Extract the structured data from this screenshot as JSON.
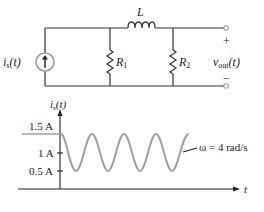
{
  "circuit": {
    "source_label": "i",
    "source_sub": "s",
    "source_arg": "(t)",
    "inductor_label": "L",
    "r1_label": "R",
    "r1_sub": "1",
    "r2_label": "R",
    "r2_sub": "2",
    "vout_label": "v",
    "vout_sub": "out",
    "vout_arg": "(t)",
    "plus": "+",
    "minus": "−"
  },
  "graph": {
    "y_axis_label": "i",
    "y_axis_sub": "s",
    "y_axis_arg": "(t)",
    "x_axis_label": "t",
    "tick_labels": [
      "1.5 A",
      "1 A",
      "0.5 A"
    ],
    "annotation": "ω = 4 rad/s"
  },
  "colors": {
    "wire": "#333333",
    "signal": "#a0a0a0"
  }
}
